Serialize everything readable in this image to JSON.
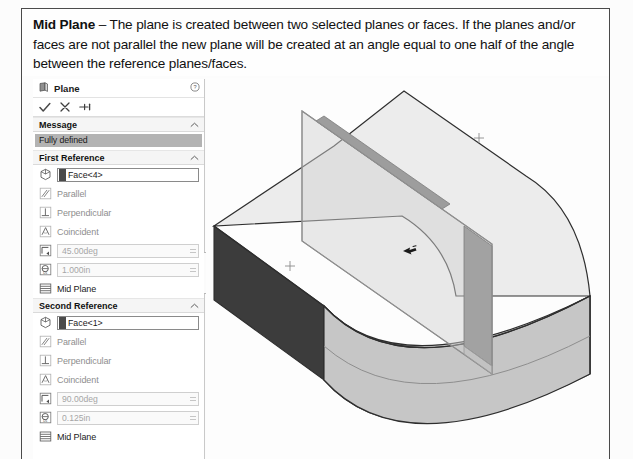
{
  "caption": {
    "term": "Mid Plane",
    "body": " – The plane is created between two selected planes or faces. If the planes and/or faces are not parallel the new plane will be created at an angle equal to one half of the angle between the reference planes/faces."
  },
  "property_manager": {
    "title": "Plane",
    "title_icon": "plane-icon",
    "help_icon": "help-icon",
    "actions": [
      {
        "name": "ok-button",
        "icon": "checkmark-icon"
      },
      {
        "name": "cancel-button",
        "icon": "close-x-icon"
      },
      {
        "name": "detailed-preview-button",
        "icon": "pin-icon"
      }
    ],
    "message_section": {
      "header": "Message",
      "collapse_icon": "chevron-up-icon",
      "status": "Fully defined",
      "status_bg": "#b3b3b3"
    },
    "first_reference": {
      "header": "First Reference",
      "collapse_icon": "chevron-up-icon",
      "selection": {
        "icon": "face-selection-icon",
        "value": "Face<4>"
      },
      "constraints": [
        {
          "icon": "parallel-icon",
          "label": "Parallel",
          "enabled": false
        },
        {
          "icon": "perpendicular-icon",
          "label": "Perpendicular",
          "enabled": false
        },
        {
          "icon": "coincident-icon",
          "label": "Coincident",
          "enabled": false
        }
      ],
      "angle": {
        "icon": "angle-icon",
        "value": "45.00deg",
        "enabled": false
      },
      "distance": {
        "icon": "distance-icon",
        "value": "1.000in",
        "enabled": false
      },
      "mid_plane": {
        "icon": "mid-plane-icon",
        "label": "Mid Plane"
      }
    },
    "second_reference": {
      "header": "Second Reference",
      "collapse_icon": "chevron-up-icon",
      "selection": {
        "icon": "face-selection-icon",
        "value": "Face<1>"
      },
      "constraints": [
        {
          "icon": "parallel-icon",
          "label": "Parallel",
          "enabled": false
        },
        {
          "icon": "perpendicular-icon",
          "label": "Perpendicular",
          "enabled": false
        },
        {
          "icon": "coincident-icon",
          "label": "Coincident",
          "enabled": false
        }
      ],
      "angle": {
        "icon": "angle-icon",
        "value": "90.00deg",
        "enabled": false
      },
      "distance": {
        "icon": "distance-icon",
        "value": "0.125in",
        "enabled": false
      },
      "mid_plane": {
        "icon": "mid-plane-icon",
        "label": "Mid Plane"
      }
    },
    "collapse_tab": "panel-collapse-tab"
  },
  "graphics": {
    "name": "3d-model-viewport",
    "model": "curved-solid-block",
    "cursor_icon": "selection-arrow-cursor",
    "colors": {
      "dark_face": "#3c3c3c",
      "front_face": "#c2c2c2",
      "top_face": "#ececec",
      "plane_fill": "#cfcfcf",
      "plane_edge": "#9a9a9a",
      "outline": "#2e2e2e"
    }
  }
}
